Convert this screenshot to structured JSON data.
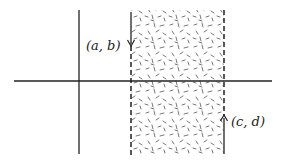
{
  "diagram": {
    "type": "coordinate-plane-strip",
    "colors": {
      "axis": "#222222",
      "dashed_line": "#222222",
      "hatch": "#555555",
      "background": "#ffffff"
    },
    "axes": {
      "horizontal": {
        "x1": 14,
        "x2": 272,
        "y": 81
      },
      "vertical": {
        "x": 79,
        "y1": 10,
        "y2": 154
      }
    },
    "strip": {
      "left_x": 131,
      "right_x": 224,
      "top_y": 10,
      "bottom_y": 154
    },
    "points": [
      {
        "label": "(a,b)",
        "text": "(a, b)",
        "arrow": "down",
        "x": 131,
        "arrow_from_y": 12,
        "arrow_to_y": 46,
        "label_x": 86,
        "label_y": 49
      },
      {
        "label": "(c,d)",
        "text": "(c, d)",
        "arrow": "up",
        "x": 224,
        "arrow_from_y": 154,
        "arrow_to_y": 116,
        "label_x": 231,
        "label_y": 125
      }
    ]
  }
}
